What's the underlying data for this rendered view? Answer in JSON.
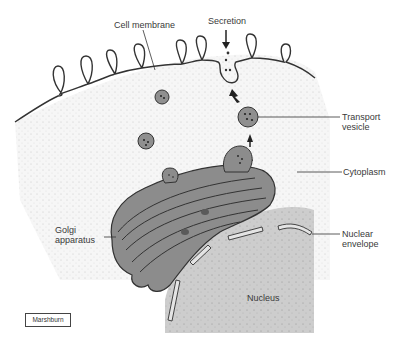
{
  "figure": {
    "type": "biology-illustration"
  },
  "labels": {
    "cell_membrane": "Cell membrane",
    "secretion": "Secretion",
    "transport_vesicle_line1": "Transport",
    "transport_vesicle_line2": "vesicle",
    "cytoplasm": "Cytoplasm",
    "golgi_line1": "Golgi",
    "golgi_line2": "apparatus",
    "nuclear_envelope_line1": "Nuclear",
    "nuclear_envelope_line2": "envelope",
    "nucleus": "Nucleus"
  },
  "credit": {
    "artist": "Marshburn"
  },
  "colors": {
    "cytoplasm_fill": "#f4f4f4",
    "organelle_fill": "#8c8c8c",
    "organelle_dark": "#5a5a5a",
    "nucleus_fill": "#cfcfcf",
    "line": "#333333",
    "text": "#3a3a3a"
  }
}
